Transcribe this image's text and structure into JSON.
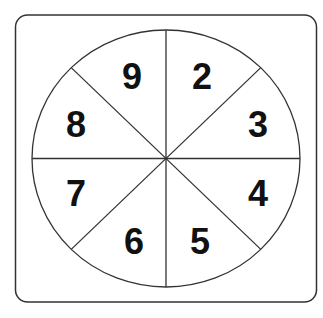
{
  "spinner": {
    "sections": 8,
    "numbers": [
      "2",
      "3",
      "4",
      "5",
      "6",
      "7",
      "8",
      "9"
    ],
    "colors": {
      "stroke": "#333333",
      "text": "#111111",
      "background": "#ffffff"
    }
  }
}
